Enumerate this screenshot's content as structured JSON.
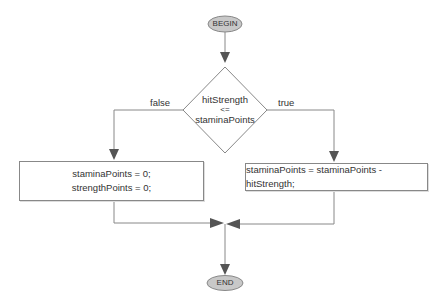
{
  "diagram": {
    "type": "flowchart",
    "start": {
      "label": "BEGIN"
    },
    "end": {
      "label": "END"
    },
    "decision": {
      "lines": [
        "hitStrength",
        "<=",
        "staminaPoints"
      ]
    },
    "branches": {
      "false": {
        "label": "false",
        "statements": [
          "staminaPoints = 0;",
          "strengthPoints = 0;"
        ]
      },
      "true": {
        "label": "true",
        "statements": [
          "staminaPoints = staminaPoints - hitStrength;"
        ]
      }
    },
    "colors": {
      "oval_fill": "#c8c8c8",
      "line": "#888888",
      "arrow": "#555555"
    }
  }
}
